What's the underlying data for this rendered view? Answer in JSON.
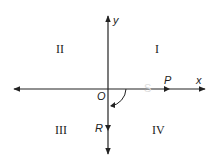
{
  "diagram": {
    "type": "coordinate-plane-angle",
    "axes": {
      "x_label": "x",
      "y_label": "y"
    },
    "origin_label": "O",
    "points": {
      "P": "P",
      "R": "R"
    },
    "faint_label": "S",
    "quadrants": [
      "I",
      "II",
      "III",
      "IV"
    ],
    "colors": {
      "line": "#222222",
      "faint": "#dddddd"
    }
  }
}
